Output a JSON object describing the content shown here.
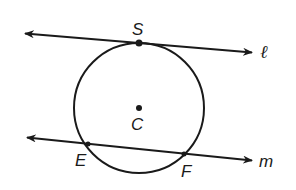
{
  "diagram": {
    "type": "geometry",
    "circle": {
      "center_label": "C",
      "cx": 139,
      "cy": 108,
      "r": 65
    },
    "lines": [
      {
        "name": "ℓ",
        "kind": "tangent",
        "x1": 25,
        "y1": 33,
        "x2": 252,
        "y2": 52,
        "points": [
          "S"
        ]
      },
      {
        "name": "m",
        "kind": "secant",
        "x1": 27,
        "y1": 137,
        "x2": 252,
        "y2": 160,
        "points": [
          "E",
          "F"
        ]
      }
    ],
    "points": [
      {
        "label": "S",
        "x": 139,
        "y": 43
      },
      {
        "label": "C",
        "x": 139,
        "y": 108
      },
      {
        "label": "E",
        "x": 88,
        "y": 144
      },
      {
        "label": "F",
        "x": 184,
        "y": 154
      }
    ],
    "labels": {
      "S": "S",
      "C": "C",
      "E": "E",
      "F": "F",
      "l": "ℓ",
      "m": "m"
    },
    "colors": {
      "stroke": "#1a1a1a",
      "background": "#ffffff"
    }
  }
}
